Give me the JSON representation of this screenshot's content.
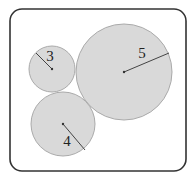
{
  "diagram": {
    "type": "tangent-circles",
    "frame": {
      "x": 10,
      "y": 9,
      "width": 176,
      "height": 162,
      "corner_radius": 12,
      "stroke": "#333333"
    },
    "circle_fill": "#d9d9d9",
    "circle_stroke": "#aaaaaa",
    "circles": [
      {
        "id": "small",
        "label": "3",
        "cx": 52,
        "cy": 69,
        "r": 23,
        "radius_end": {
          "x": 36,
          "y": 53
        },
        "label_pos": {
          "x": 50,
          "y": 61
        }
      },
      {
        "id": "large",
        "label": "5",
        "cx": 124,
        "cy": 72,
        "r": 48,
        "radius_end": {
          "x": 169,
          "y": 53
        },
        "label_pos": {
          "x": 142,
          "y": 58
        }
      },
      {
        "id": "medium",
        "label": "4",
        "cx": 63,
        "cy": 124,
        "r": 32,
        "radius_end": {
          "x": 85,
          "y": 150
        },
        "label_pos": {
          "x": 67,
          "y": 146
        }
      }
    ]
  }
}
